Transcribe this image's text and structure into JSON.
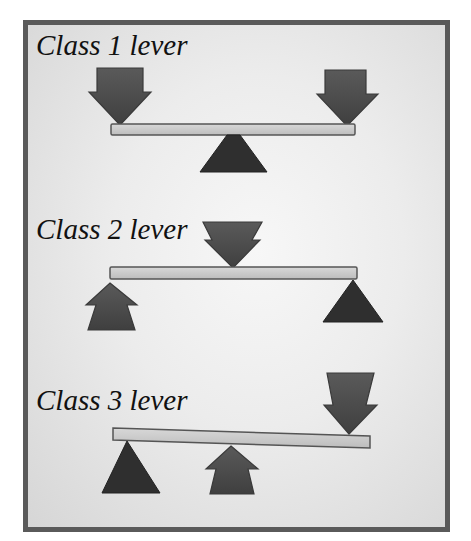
{
  "diagram": {
    "colors": {
      "frame_border": "#5a5a5a",
      "background_center": "#f7f7f7",
      "background_edge": "#d6d6d6",
      "beam_fill": "#c9c9c9",
      "beam_outline": "#555555",
      "arrow_fill": "#4f4f4f",
      "fulcrum_fill": "#2f2f2f",
      "text": "#111111"
    },
    "panels": [
      {
        "label": "Class 1 lever",
        "arrangement": "effort - fulcrum - load",
        "elements": [
          "down arrow (left end)",
          "fulcrum (middle)",
          "down arrow (right end)"
        ]
      },
      {
        "label": "Class 2 lever",
        "arrangement": "effort - load - fulcrum",
        "elements": [
          "up arrow (left end)",
          "down arrow (middle)",
          "fulcrum (right end)"
        ]
      },
      {
        "label": "Class 3 lever",
        "arrangement": "fulcrum - effort - load",
        "elements": [
          "fulcrum (left end)",
          "up arrow (middle)",
          "down arrow (right end)"
        ]
      }
    ]
  }
}
